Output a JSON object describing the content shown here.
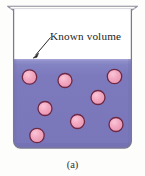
{
  "figure": {
    "caption": "(a)",
    "annotation": {
      "label": "Known volume",
      "label_x": 50,
      "label_y": 40,
      "leader_from": [
        50.5,
        37.5
      ],
      "leader_to": [
        33.5,
        57.5
      ]
    },
    "colors": {
      "liquid": "#7b79bd",
      "liquid_top_highlight": "#9a99cf",
      "liquid_shade": "#6f6db2",
      "particle_fill": "#f0a0bb",
      "particle_fill_light": "#f7bcd0",
      "particle_stroke": "#6d2844",
      "beaker_outline": "#7c7a8f",
      "beaker_glass": "#ffffff",
      "background": "#fdfdfc",
      "text": "#1b1b1b",
      "caption": "#33302f"
    },
    "beaker": {
      "rim_left": 7,
      "rim_right": 138,
      "rim_y": 6,
      "wall_left": 13,
      "wall_right": 132,
      "wall_top": 9,
      "bottom_y": 148,
      "corner_radius": 7,
      "liquid_surface_y": 59
    },
    "particles": [
      {
        "id": 1,
        "cx": 29.5,
        "cy": 77.0,
        "r": 7.2
      },
      {
        "id": 2,
        "cx": 65.0,
        "cy": 80.5,
        "r": 7.0
      },
      {
        "id": 3,
        "cx": 114.5,
        "cy": 76.5,
        "r": 7.2
      },
      {
        "id": 4,
        "cx": 98.0,
        "cy": 97.5,
        "r": 7.0
      },
      {
        "id": 5,
        "cx": 45.0,
        "cy": 108.5,
        "r": 7.0
      },
      {
        "id": 6,
        "cx": 77.5,
        "cy": 121.5,
        "r": 7.0
      },
      {
        "id": 7,
        "cx": 116.0,
        "cy": 124.5,
        "r": 7.0
      },
      {
        "id": 8,
        "cx": 37.0,
        "cy": 135.5,
        "r": 7.2
      }
    ],
    "particle_count": 8
  }
}
